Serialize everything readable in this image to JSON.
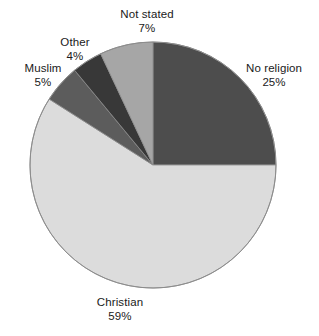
{
  "chart_data": {
    "type": "pie",
    "title": "",
    "categories": [
      "No religion",
      "Not stated",
      "Other",
      "Muslim",
      "Christian"
    ],
    "values": [
      25,
      7,
      4,
      5,
      59
    ],
    "value_suffix": "%",
    "slices": [
      {
        "label": "No religion",
        "value": 25,
        "value_text": "25%",
        "color": "#4d4d4d",
        "start_angle": 0,
        "end_angle": 90
      },
      {
        "label": "Not stated",
        "value": 7,
        "value_text": "7%",
        "color": "#a6a6a6",
        "start_angle": 334.8,
        "end_angle": 360
      },
      {
        "label": "Other",
        "value": 4,
        "value_text": "4%",
        "color": "#383838",
        "start_angle": 320.4,
        "end_angle": 334.8
      },
      {
        "label": "Muslim",
        "value": 5,
        "value_text": "5%",
        "color": "#5c5c5c",
        "start_angle": 302.4,
        "end_angle": 320.4
      },
      {
        "label": "Christian",
        "value": 59,
        "value_text": "59%",
        "color": "#dcdcdc",
        "start_angle": 90,
        "end_angle": 302.4
      }
    ],
    "legend": "none",
    "grid": false,
    "background_color": "#ffffff",
    "outline_color": "#8c8c8c",
    "text_color": "#1a1a1a",
    "total": 100,
    "geometry": {
      "center_x": 153,
      "center_y": 165,
      "radius": 123
    }
  }
}
